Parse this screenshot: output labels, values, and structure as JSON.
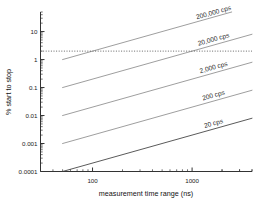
{
  "chart_data": {
    "type": "line",
    "title": "",
    "xlabel": "measurement time range (ns)",
    "ylabel": "% start to stop",
    "xscale": "log",
    "yscale": "log",
    "xlim": [
      30,
      4000
    ],
    "ylim": [
      0.0001,
      50
    ],
    "xticks": [
      100,
      1000
    ],
    "xticklabels": [
      "100",
      "1000"
    ],
    "yticks": [
      10,
      1,
      0.1,
      0.01,
      0.001,
      0.0001
    ],
    "yticklabels": [
      "10",
      "1",
      "0.1",
      "0.01",
      "0.001",
      "0.0001"
    ],
    "grid": false,
    "legend_position": "inline-right",
    "series": [
      {
        "name": "200,000 cps",
        "label": "200,000 cps",
        "color": "#8c8c8c",
        "x": [
          50,
          4000
        ],
        "y": [
          1.0,
          80.0
        ]
      },
      {
        "name": "20,000 cps",
        "label": "20,000 cps",
        "color": "#8c8c8c",
        "x": [
          50,
          4000
        ],
        "y": [
          0.1,
          8.0
        ]
      },
      {
        "name": "2,000 cps",
        "label": "2,000 cps",
        "color": "#8c8c8c",
        "x": [
          50,
          4000
        ],
        "y": [
          0.01,
          0.8
        ]
      },
      {
        "name": "200 cps",
        "label": "200 cps",
        "color": "#8c8c8c",
        "x": [
          50,
          4000
        ],
        "y": [
          0.001,
          0.08
        ]
      },
      {
        "name": "20 cps",
        "label": "20 cps",
        "color": "#3c3c3c",
        "x": [
          50,
          4000
        ],
        "y": [
          0.0001,
          0.008
        ]
      }
    ],
    "reference_lines": [
      {
        "name": "threshold-line",
        "orientation": "horizontal",
        "value": 2.0,
        "style": "dotted",
        "color": "#555555"
      }
    ]
  }
}
